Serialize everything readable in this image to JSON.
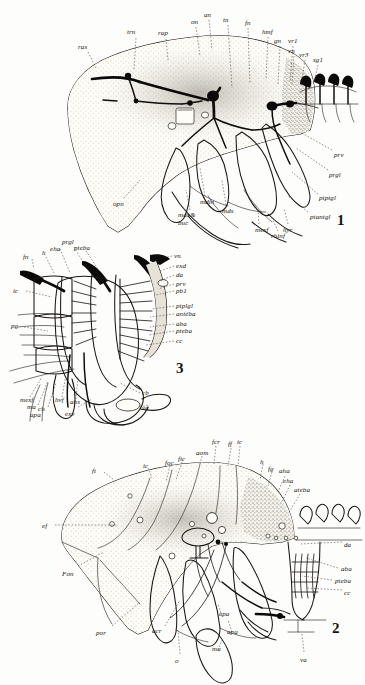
{
  "plate": {
    "title": "Anatomical plate — insect head nervous system, three figures",
    "background_color": "#fdfdfb",
    "ink_color": "#1a1713"
  },
  "figures": [
    {
      "number": "1",
      "number_pos": {
        "x": 337,
        "y": 212
      },
      "caption_region": "upper",
      "labels": [
        {
          "text": "ras",
          "x": 78,
          "y": 44
        },
        {
          "text": "trn",
          "x": 127,
          "y": 29
        },
        {
          "text": "rap",
          "x": 158,
          "y": 30
        },
        {
          "text": "on",
          "x": 191,
          "y": 19
        },
        {
          "text": "an",
          "x": 204,
          "y": 12
        },
        {
          "text": "tn",
          "x": 223,
          "y": 17
        },
        {
          "text": "fn",
          "x": 245,
          "y": 20
        },
        {
          "text": "hmf",
          "x": 262,
          "y": 29
        },
        {
          "text": "gn",
          "x": 274,
          "y": 38
        },
        {
          "text": "vr1",
          "x": 288,
          "y": 38
        },
        {
          "text": "vn",
          "x": 288,
          "y": 48
        },
        {
          "text": "vr3",
          "x": 299,
          "y": 52
        },
        {
          "text": "sg1",
          "x": 313,
          "y": 57
        },
        {
          "text": "prv",
          "x": 334,
          "y": 152
        },
        {
          "text": "prgl",
          "x": 329,
          "y": 172
        },
        {
          "text": "ptptgl",
          "x": 319,
          "y": 195
        },
        {
          "text": "ptantgl",
          "x": 310,
          "y": 214
        },
        {
          "text": "hyr",
          "x": 283,
          "y": 227
        },
        {
          "text": "rhinf",
          "x": 271,
          "y": 233
        },
        {
          "text": "mexf",
          "x": 255,
          "y": 227
        },
        {
          "text": "opn",
          "x": 113,
          "y": 201
        },
        {
          "text": "mdin",
          "x": 200,
          "y": 199
        },
        {
          "text": "mds",
          "x": 222,
          "y": 208
        },
        {
          "text": "max&",
          "x": 178,
          "y": 212
        },
        {
          "text": "buc",
          "x": 178,
          "y": 220
        }
      ]
    },
    {
      "number": "3",
      "number_pos": {
        "x": 176,
        "y": 360
      },
      "caption_region": "middle",
      "labels": [
        {
          "text": "prgl",
          "x": 62,
          "y": 239
        },
        {
          "text": "eha",
          "x": 50,
          "y": 246
        },
        {
          "text": "pteba",
          "x": 74,
          "y": 245
        },
        {
          "text": "fn",
          "x": 23,
          "y": 254
        },
        {
          "text": "h",
          "x": 42,
          "y": 250
        },
        {
          "text": "ic",
          "x": 13,
          "y": 288
        },
        {
          "text": "pg",
          "x": 11,
          "y": 323
        },
        {
          "text": "vn",
          "x": 174,
          "y": 253
        },
        {
          "text": "exd",
          "x": 176,
          "y": 263
        },
        {
          "text": "da",
          "x": 176,
          "y": 272
        },
        {
          "text": "prv",
          "x": 176,
          "y": 281
        },
        {
          "text": "pb1",
          "x": 176,
          "y": 288
        },
        {
          "text": "ptplgl",
          "x": 176,
          "y": 303
        },
        {
          "text": "antéba",
          "x": 176,
          "y": 311
        },
        {
          "text": "aba",
          "x": 176,
          "y": 321
        },
        {
          "text": "pteba",
          "x": 176,
          "y": 328
        },
        {
          "text": "cc",
          "x": 176,
          "y": 338
        },
        {
          "text": "cb",
          "x": 142,
          "y": 390
        },
        {
          "text": "va",
          "x": 142,
          "y": 405
        },
        {
          "text": "mexf",
          "x": 20,
          "y": 397
        },
        {
          "text": "ma",
          "x": 27,
          "y": 404
        },
        {
          "text": "ch",
          "x": 38,
          "y": 406
        },
        {
          "text": "apa",
          "x": 30,
          "y": 412
        },
        {
          "text": "hvf",
          "x": 55,
          "y": 397
        },
        {
          "text": "ahs",
          "x": 70,
          "y": 399
        },
        {
          "text": "exv",
          "x": 65,
          "y": 411
        }
      ]
    },
    {
      "number": "2",
      "number_pos": {
        "x": 332,
        "y": 620
      },
      "caption_region": "lower",
      "labels": [
        {
          "text": "ft",
          "x": 92,
          "y": 468
        },
        {
          "text": "ic",
          "x": 143,
          "y": 463
        },
        {
          "text": "foc",
          "x": 165,
          "y": 460
        },
        {
          "text": "fic",
          "x": 178,
          "y": 456
        },
        {
          "text": "aom",
          "x": 196,
          "y": 450
        },
        {
          "text": "fcr",
          "x": 212,
          "y": 439
        },
        {
          "text": "ff",
          "x": 228,
          "y": 441
        },
        {
          "text": "ic",
          "x": 237,
          "y": 439
        },
        {
          "text": "h",
          "x": 260,
          "y": 459
        },
        {
          "text": "fg",
          "x": 268,
          "y": 466
        },
        {
          "text": "aha",
          "x": 279,
          "y": 468
        },
        {
          "text": "eha",
          "x": 283,
          "y": 478
        },
        {
          "text": "ateba",
          "x": 294,
          "y": 487
        },
        {
          "text": "ef",
          "x": 42,
          "y": 523
        },
        {
          "text": "Fon",
          "x": 62,
          "y": 571
        },
        {
          "text": "por",
          "x": 96,
          "y": 630
        },
        {
          "text": "acr",
          "x": 152,
          "y": 628
        },
        {
          "text": "o",
          "x": 175,
          "y": 658
        },
        {
          "text": "epa",
          "x": 219,
          "y": 611
        },
        {
          "text": "apa",
          "x": 227,
          "y": 629
        },
        {
          "text": "ma",
          "x": 212,
          "y": 646
        },
        {
          "text": "da",
          "x": 344,
          "y": 542
        },
        {
          "text": "aba",
          "x": 341,
          "y": 566
        },
        {
          "text": "pteba",
          "x": 335,
          "y": 578
        },
        {
          "text": "cc",
          "x": 344,
          "y": 590
        },
        {
          "text": "va",
          "x": 300,
          "y": 657
        }
      ]
    }
  ]
}
